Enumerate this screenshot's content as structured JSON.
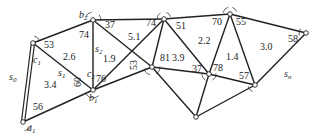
{
  "diagram": {
    "type": "triangulation-network",
    "nodes": {
      "a1": {
        "x": 23,
        "y": 122,
        "label": "a",
        "sub": "1"
      },
      "c1top": {
        "x": 33,
        "y": 43
      },
      "b2": {
        "x": 93,
        "y": 20,
        "label": "b",
        "sub": "2"
      },
      "b1": {
        "x": 93,
        "y": 90,
        "label": "b",
        "sub": "1"
      },
      "t1": {
        "x": 164,
        "y": 19
      },
      "m1": {
        "x": 152,
        "y": 67
      },
      "bot": {
        "x": 196,
        "y": 117
      },
      "m2": {
        "x": 209,
        "y": 74
      },
      "t2": {
        "x": 230,
        "y": 14
      },
      "r1": {
        "x": 255,
        "y": 85
      },
      "r2": {
        "x": 306,
        "y": 33
      }
    },
    "edges": [
      [
        "a1",
        "c1top",
        "double"
      ],
      [
        "a1",
        "b1"
      ],
      [
        "c1top",
        "b2"
      ],
      [
        "c1top",
        "b1"
      ],
      [
        "b2",
        "b1"
      ],
      [
        "b2",
        "t1"
      ],
      [
        "b2",
        "m1"
      ],
      [
        "b1",
        "t1"
      ],
      [
        "b1",
        "m1"
      ],
      [
        "t1",
        "m1"
      ],
      [
        "t1",
        "t2"
      ],
      [
        "t1",
        "m2"
      ],
      [
        "m1",
        "m2"
      ],
      [
        "m1",
        "bot"
      ],
      [
        "m2",
        "bot"
      ],
      [
        "m2",
        "t2"
      ],
      [
        "m2",
        "r1"
      ],
      [
        "t2",
        "r1"
      ],
      [
        "t2",
        "r2"
      ],
      [
        "r1",
        "r2"
      ],
      [
        "r1",
        "bot"
      ]
    ],
    "angle_labels": [
      {
        "text": "53",
        "x": 44,
        "y": 48
      },
      {
        "text": "56",
        "x": 33,
        "y": 110
      },
      {
        "text": "74",
        "x": 79,
        "y": 38
      },
      {
        "text": "76",
        "x": 96,
        "y": 82
      },
      {
        "text": "60",
        "x": 81,
        "y": 87,
        "rotate": -90
      },
      {
        "text": "37",
        "x": 105,
        "y": 28
      },
      {
        "text": "74",
        "x": 146,
        "y": 26
      },
      {
        "text": "51",
        "x": 176,
        "y": 29
      },
      {
        "text": "53",
        "x": 137,
        "y": 70,
        "rotate": -90
      },
      {
        "text": "81",
        "x": 160,
        "y": 61
      },
      {
        "text": "37",
        "x": 192,
        "y": 72
      },
      {
        "text": "78",
        "x": 213,
        "y": 71
      },
      {
        "text": "70",
        "x": 212,
        "y": 25
      },
      {
        "text": "55",
        "x": 236,
        "y": 25
      },
      {
        "text": "57",
        "x": 239,
        "y": 79
      },
      {
        "text": "58",
        "x": 288,
        "y": 42
      }
    ],
    "area_labels": [
      {
        "text": "2.6",
        "x": 63,
        "y": 60
      },
      {
        "text": "3.4",
        "x": 44,
        "y": 88
      },
      {
        "text": "1.9",
        "x": 103,
        "y": 62
      },
      {
        "text": "5.1",
        "x": 128,
        "y": 40
      },
      {
        "text": "3.9",
        "x": 172,
        "y": 61
      },
      {
        "text": "2.2",
        "x": 198,
        "y": 44
      },
      {
        "text": "1.4",
        "x": 226,
        "y": 60
      },
      {
        "text": "3.0",
        "x": 260,
        "y": 50
      }
    ],
    "var_labels": [
      {
        "text": "s",
        "sub": "0",
        "x": 9,
        "y": 80
      },
      {
        "text": "s",
        "sub": "1",
        "x": 58,
        "y": 76
      },
      {
        "text": "s",
        "sub": "2",
        "x": 95,
        "y": 52
      },
      {
        "text": "c",
        "sub": "1",
        "x": 33,
        "y": 63
      },
      {
        "text": "c",
        "sub": "2",
        "x": 87,
        "y": 77
      },
      {
        "text": "s",
        "sub": "n",
        "x": 284,
        "y": 77
      }
    ],
    "line_color": "#222222",
    "node_fill": "#ffffff"
  }
}
